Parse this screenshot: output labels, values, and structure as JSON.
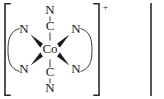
{
  "figure": {
    "kind": "chemical-structure-diagram",
    "caption_text": "",
    "complex_name": "Co",
    "charge": "+",
    "background_color": "#ffffff",
    "line_color": "#3a3a3a",
    "text_color": "#1a1a1a",
    "bracket_color": "#2a2a2a"
  },
  "metal_center": {
    "label": "Co",
    "x": 50,
    "y": 50
  },
  "cyanide_ligands": [
    {
      "id": "cyanide-axial-top",
      "carbon_label": "C",
      "carbon_x": 50,
      "carbon_y": 27,
      "nitrogen_label": "N",
      "nitrogen_x": 50,
      "nitrogen_y": 11
    },
    {
      "id": "cyanide-axial-bottom",
      "carbon_label": "C",
      "carbon_x": 50,
      "carbon_y": 73,
      "nitrogen_label": "N",
      "nitrogen_x": 50,
      "nitrogen_y": 89
    }
  ],
  "amine_donors": [
    {
      "id": "nitrogen-upper-left",
      "label": "N",
      "x": 24,
      "y": 30
    },
    {
      "id": "nitrogen-lower-left",
      "label": "N",
      "x": 24,
      "y": 70
    },
    {
      "id": "nitrogen-upper-right",
      "label": "N",
      "x": 76,
      "y": 30
    },
    {
      "id": "nitrogen-lower-right",
      "label": "N",
      "x": 76,
      "y": 70
    }
  ],
  "chelate_backbones": [
    {
      "id": "chelate-arc-left",
      "side": "left"
    },
    {
      "id": "chelate-arc-right",
      "side": "right"
    }
  ],
  "brackets": {
    "left_x": 5,
    "right_x": 99,
    "top_y": 3,
    "bottom_y": 96,
    "serif_width": 5,
    "charge_superscript": "+",
    "charge_x": 104,
    "charge_y": 7
  },
  "adjacent_fragment": {
    "id": "neighbor-bracket-edge",
    "x": 151,
    "top_y": 3,
    "bottom_y": 96
  }
}
